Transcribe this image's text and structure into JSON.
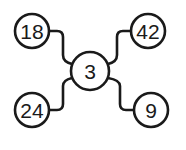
{
  "diagram": {
    "center": {
      "label": "3"
    },
    "nodes": [
      {
        "label": "18",
        "position": "top-left"
      },
      {
        "label": "42",
        "position": "top-right"
      },
      {
        "label": "24",
        "position": "bottom-left"
      },
      {
        "label": "9",
        "position": "bottom-right"
      }
    ],
    "colors": {
      "stroke": "#1a1a1a",
      "fill": "#ffffff"
    }
  }
}
